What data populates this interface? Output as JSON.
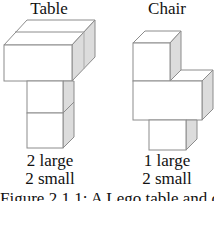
{
  "figure": {
    "models": [
      {
        "title": "Table",
        "counts": [
          "2 large",
          "2 small"
        ]
      },
      {
        "title": "Chair",
        "counts": [
          "1 large",
          "2 small"
        ]
      }
    ],
    "caption": "Figure 2.1.1: A Lego table and chair"
  },
  "colors": {
    "face": "#ffffff",
    "side": "#d9d9d9",
    "edge": "#8c8c8c"
  }
}
